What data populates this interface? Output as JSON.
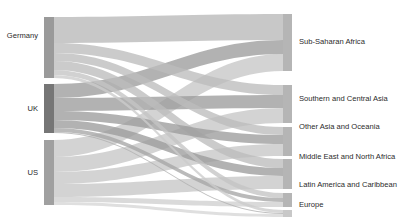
{
  "chart_data": {
    "type": "sankey",
    "title": "",
    "subtitle": "",
    "xlabel": "",
    "ylabel": "",
    "grid": false,
    "legend": "none",
    "background_color": "#ffffff",
    "label_color": "#2b2b2b",
    "source_nodes": [
      {
        "id": "germany",
        "label": "Germany",
        "value": 61,
        "color": "#a6a6a6",
        "bar_color": "#9a9a9a"
      },
      {
        "id": "uk",
        "label": "UK",
        "value": 49,
        "color": "#8e8e8e",
        "bar_color": "#767676"
      },
      {
        "id": "us",
        "label": "US",
        "value": 65,
        "color": "#bdbdbd",
        "bar_color": "#a0a0a0"
      }
    ],
    "target_nodes": [
      {
        "id": "ssa",
        "label": "Sub-Saharan Africa",
        "value": 57,
        "color": "#b5b5b5"
      },
      {
        "id": "sca",
        "label": "Southern and Central Asia",
        "value": 38,
        "color": "#b5b5b5"
      },
      {
        "id": "oao",
        "label": "Other Asia and Oceania",
        "value": 29,
        "color": "#b5b5b5"
      },
      {
        "id": "mena",
        "label": "Middle East and North Africa",
        "value": 30,
        "color": "#b5b5b5"
      },
      {
        "id": "lac",
        "label": "Latin America and Caribbean",
        "value": 14,
        "color": "#b5b5b5"
      },
      {
        "id": "europe",
        "label": "Europe",
        "value": 7,
        "color": "#c8c8c8"
      }
    ],
    "links": [
      {
        "source": "germany",
        "target": "ssa",
        "value": 26,
        "color": "#b9b9b9"
      },
      {
        "source": "germany",
        "target": "sca",
        "value": 10,
        "color": "#bdbdbd"
      },
      {
        "source": "germany",
        "target": "oao",
        "value": 8,
        "color": "#bdbdbd"
      },
      {
        "source": "germany",
        "target": "mena",
        "value": 9,
        "color": "#bdbdbd"
      },
      {
        "source": "germany",
        "target": "lac",
        "value": 5,
        "color": "#c4c4c4"
      },
      {
        "source": "germany",
        "target": "europe",
        "value": 3,
        "color": "#cccccc"
      },
      {
        "source": "uk",
        "target": "ssa",
        "value": 14,
        "color": "#9c9c9c"
      },
      {
        "source": "uk",
        "target": "sca",
        "value": 13,
        "color": "#9c9c9c"
      },
      {
        "source": "uk",
        "target": "oao",
        "value": 9,
        "color": "#9c9c9c"
      },
      {
        "source": "uk",
        "target": "mena",
        "value": 8,
        "color": "#9c9c9c"
      },
      {
        "source": "uk",
        "target": "lac",
        "value": 4,
        "color": "#a6a6a6"
      },
      {
        "source": "uk",
        "target": "europe",
        "value": 1,
        "color": "#b0b0b0"
      },
      {
        "source": "us",
        "target": "ssa",
        "value": 17,
        "color": "#c6c6c6"
      },
      {
        "source": "us",
        "target": "sca",
        "value": 15,
        "color": "#c6c6c6"
      },
      {
        "source": "us",
        "target": "oao",
        "value": 12,
        "color": "#c6c6c6"
      },
      {
        "source": "us",
        "target": "mena",
        "value": 13,
        "color": "#c6c6c6"
      },
      {
        "source": "us",
        "target": "lac",
        "value": 5,
        "color": "#cfcfcf"
      },
      {
        "source": "us",
        "target": "europe",
        "value": 3,
        "color": "#d6d6d6"
      }
    ],
    "geometry": {
      "width": 413,
      "height": 223,
      "left_node_x": 44,
      "left_node_width": 10,
      "right_node_x": 283,
      "right_node_width": 9,
      "left_nodes": [
        {
          "id": "germany",
          "y": 17,
          "h": 61
        },
        {
          "id": "uk",
          "y": 84,
          "h": 49
        },
        {
          "id": "us",
          "y": 140,
          "h": 65
        }
      ],
      "right_nodes": [
        {
          "id": "ssa",
          "y": 14,
          "h": 57
        },
        {
          "id": "sca",
          "y": 85,
          "h": 38
        },
        {
          "id": "oao",
          "y": 127,
          "h": 29
        },
        {
          "id": "mena",
          "y": 159,
          "h": 30
        },
        {
          "id": "lac",
          "y": 193,
          "h": 14
        },
        {
          "id": "europe",
          "y": 210,
          "h": 7
        }
      ],
      "label_left_x": 38,
      "label_right_x": 299,
      "source_label_y": {
        "germany": 38,
        "uk": 111,
        "us": 175
      },
      "target_label_y": {
        "ssa": 44,
        "sca": 101,
        "oao": 129,
        "mena": 159,
        "lac": 187,
        "europe": 207
      },
      "link_order_at_source": {
        "germany": [
          "ssa",
          "sca",
          "oao",
          "mena",
          "lac",
          "europe"
        ],
        "uk": [
          "ssa",
          "sca",
          "oao",
          "mena",
          "lac",
          "europe"
        ],
        "us": [
          "ssa",
          "sca",
          "oao",
          "mena",
          "lac",
          "europe"
        ]
      },
      "link_order_at_target": {
        "ssa": [
          "germany",
          "uk",
          "us"
        ],
        "sca": [
          "germany",
          "uk",
          "us"
        ],
        "oao": [
          "germany",
          "uk",
          "us"
        ],
        "mena": [
          "germany",
          "uk",
          "us"
        ],
        "lac": [
          "germany",
          "uk",
          "us"
        ],
        "europe": [
          "germany",
          "uk",
          "us"
        ]
      }
    }
  }
}
